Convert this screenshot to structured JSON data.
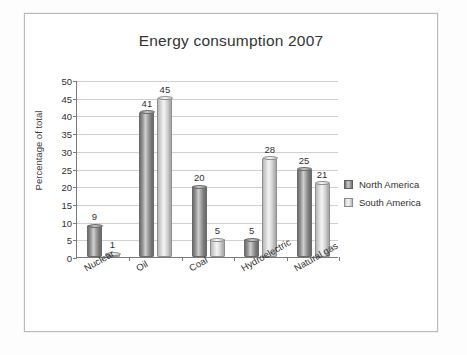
{
  "chart_data": {
    "type": "bar",
    "title": "Energy consumption 2007",
    "xlabel": "",
    "ylabel": "Percentage of total",
    "ylim": [
      0,
      50
    ],
    "ytick_step": 5,
    "yticks": [
      0,
      5,
      10,
      15,
      20,
      25,
      30,
      35,
      40,
      45,
      50
    ],
    "grid": true,
    "legend_position": "right",
    "categories": [
      "Nuclear",
      "Oil",
      "Coal",
      "Hydroelectric",
      "Natural gas"
    ],
    "series": [
      {
        "name": "North America",
        "color": "#7d7d7d",
        "values": [
          9,
          41,
          20,
          5,
          25
        ]
      },
      {
        "name": "South America",
        "color": "#dcdcdc",
        "values": [
          1,
          45,
          5,
          28,
          21
        ]
      }
    ]
  },
  "legend": {
    "items": [
      {
        "label": "North America",
        "swatch": "north"
      },
      {
        "label": "South America",
        "swatch": "south"
      }
    ]
  }
}
